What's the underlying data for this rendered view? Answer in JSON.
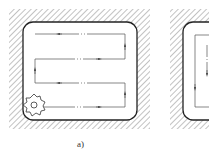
{
  "figure": {
    "panels": [
      {
        "id": "a",
        "label": "a)",
        "strategy": "zigzag",
        "passes": [
          {
            "direction": "left"
          },
          {
            "direction": "right"
          },
          {
            "direction": "left"
          },
          {
            "direction": "right"
          }
        ],
        "connectors": [
          {
            "side": "right",
            "direction": "up"
          },
          {
            "side": "left",
            "direction": "up"
          },
          {
            "side": "right",
            "direction": "up"
          }
        ],
        "tool": "end-mill-cutter"
      },
      {
        "id": "b",
        "label": "",
        "strategy": "contour",
        "partially_visible": true
      }
    ]
  },
  "colors": {
    "line": "#333333",
    "hatch": "#555555",
    "background": "#ffffff"
  }
}
